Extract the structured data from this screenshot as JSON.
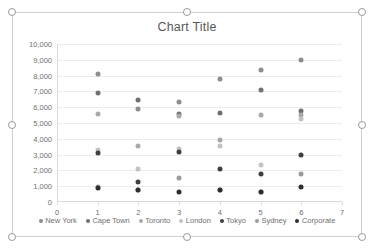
{
  "chart_data": {
    "type": "scatter",
    "title": "Chart Title",
    "xlabel": "",
    "ylabel": "",
    "xlim": [
      0,
      7
    ],
    "ylim": [
      0,
      10000
    ],
    "xticks": [
      "0",
      "1",
      "2",
      "3",
      "4",
      "5",
      "6",
      "7"
    ],
    "xtick_values": [
      0,
      1,
      2,
      3,
      4,
      5,
      6,
      7
    ],
    "yticks": [
      "0",
      "1,000",
      "2,000",
      "3,000",
      "4,000",
      "5,000",
      "6,000",
      "7,000",
      "8,000",
      "9,000",
      "10,000"
    ],
    "ytick_values": [
      0,
      1000,
      2000,
      3000,
      4000,
      5000,
      6000,
      7000,
      8000,
      9000,
      10000
    ],
    "grid": true,
    "legend_position": "bottom",
    "series": [
      {
        "name": "New York",
        "color": "#8d8d8d",
        "x": [
          1,
          2,
          3,
          4,
          5,
          6
        ],
        "y": [
          8120,
          5900,
          6340,
          7760,
          8350,
          9000
        ]
      },
      {
        "name": "Cape Town",
        "color": "#707070",
        "x": [
          1,
          2,
          3,
          4,
          5,
          6
        ],
        "y": [
          6900,
          6450,
          5560,
          5650,
          7090,
          5780
        ]
      },
      {
        "name": "Toronto",
        "color": "#a8a8a8",
        "x": [
          1,
          2,
          3,
          4,
          5,
          6
        ],
        "y": [
          5540,
          3550,
          5450,
          3900,
          5520,
          5500
        ]
      },
      {
        "name": "London",
        "color": "#c2c2c2",
        "x": [
          1,
          2,
          3,
          4,
          5,
          6
        ],
        "y": [
          3280,
          2080,
          3340,
          3560,
          2320,
          5270
        ]
      },
      {
        "name": "Tokyo",
        "color": "#3f3f3f",
        "x": [
          1,
          2,
          3,
          4,
          5,
          6
        ],
        "y": [
          3130,
          1280,
          3170,
          2120,
          1800,
          3000
        ]
      },
      {
        "name": "Sydney",
        "color": "#9b9b9b",
        "x": [
          1,
          2,
          3,
          4,
          5,
          6
        ],
        "y": [
          950,
          790,
          1520,
          760,
          640,
          1750
        ]
      },
      {
        "name": "Corporate",
        "color": "#2e2e2e",
        "x": [
          1,
          2,
          3,
          4,
          5,
          6
        ],
        "y": [
          870,
          770,
          640,
          740,
          630,
          950
        ]
      }
    ]
  },
  "selection": {
    "handles": [
      "top-left",
      "top-center",
      "top-right",
      "middle-left",
      "middle-right",
      "bottom-left",
      "bottom-center",
      "bottom-right"
    ]
  }
}
